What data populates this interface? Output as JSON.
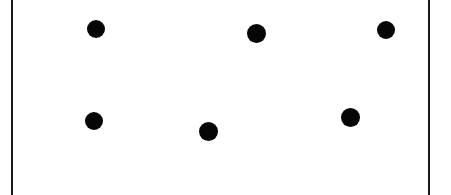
{
  "figure": {
    "width": 451,
    "height": 195,
    "background_color": "#ffffff",
    "dot_color": "#060606",
    "rule_color": "#1b1b1b"
  },
  "rules": [
    {
      "name": "left-rule",
      "x": 11,
      "width": 2
    },
    {
      "name": "right-rule",
      "x": 428,
      "width": 2
    }
  ],
  "chart_data": {
    "type": "scatter",
    "title": "",
    "xlabel": "",
    "ylabel": "",
    "xlim": [
      0,
      451
    ],
    "ylim": [
      0,
      195
    ],
    "grid": false,
    "legend": null,
    "marker": "filled-circle",
    "marker_color": "#060606",
    "series": [
      {
        "name": "dots",
        "points": [
          {
            "label": "dot-1",
            "x": 96,
            "y": 29,
            "d": 18
          },
          {
            "label": "dot-2",
            "x": 256,
            "y": 33,
            "d": 19
          },
          {
            "label": "dot-3",
            "x": 386,
            "y": 30,
            "d": 18
          },
          {
            "label": "dot-4",
            "x": 94,
            "y": 121,
            "d": 18
          },
          {
            "label": "dot-5",
            "x": 208,
            "y": 131,
            "d": 19
          },
          {
            "label": "dot-6",
            "x": 350,
            "y": 117,
            "d": 19
          }
        ]
      }
    ]
  }
}
